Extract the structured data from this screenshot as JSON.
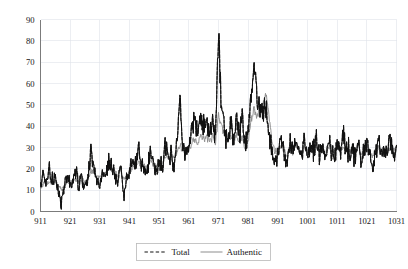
{
  "chart_data": {
    "type": "line",
    "title": "",
    "subtitle": "",
    "xlabel": "",
    "ylabel": "",
    "xlim": [
      911,
      1031
    ],
    "ylim": [
      0,
      90
    ],
    "grid": true,
    "legend_position": "bottom-center",
    "y_ticks": [
      0,
      10,
      20,
      30,
      40,
      50,
      60,
      70,
      80,
      90
    ],
    "y_tick_labels": [
      "0",
      "10",
      "20",
      "30",
      "40",
      "50",
      "60",
      "70",
      "80",
      "90"
    ],
    "x_ticks": [
      911,
      921,
      931,
      941,
      951,
      961,
      971,
      981,
      991,
      1001,
      1011,
      1021,
      1031
    ],
    "x_tick_labels": [
      "911",
      "921",
      "931",
      "941",
      "951",
      "961",
      "971",
      "981",
      "991",
      "1001",
      "1011",
      "1021",
      "1031"
    ],
    "series": [
      {
        "name": "Total",
        "style": "dashed",
        "color": "#111111",
        "x_start": 911,
        "x_step": 1,
        "values": [
          11,
          19,
          14,
          20,
          13,
          16,
          10,
          4,
          12,
          17,
          13,
          14,
          19,
          12,
          16,
          11,
          17,
          28,
          21,
          14,
          12,
          19,
          15,
          23,
          21,
          18,
          12,
          22,
          9,
          15,
          19,
          26,
          21,
          32,
          19,
          23,
          17,
          31,
          22,
          18,
          24,
          20,
          31,
          25,
          27,
          23,
          34,
          52,
          30,
          26,
          29,
          38,
          41,
          35,
          45,
          38,
          42,
          36,
          41,
          34,
          82,
          49,
          38,
          34,
          41,
          33,
          46,
          36,
          44,
          30,
          38,
          55,
          69,
          53,
          49,
          48,
          50,
          37,
          28,
          24,
          29,
          34,
          27,
          22,
          32,
          27,
          36,
          30,
          26,
          33,
          25,
          31,
          28,
          35,
          26,
          30,
          24,
          34,
          29,
          25,
          32,
          28,
          36,
          29,
          24,
          30,
          26,
          31,
          24,
          29,
          33,
          27,
          22,
          28,
          32,
          25,
          30,
          27,
          33,
          26,
          31
        ]
      },
      {
        "name": "Authentic",
        "style": "solid",
        "color": "#8d8d8d",
        "x_start": 911,
        "x_step": 1,
        "values": [
          11,
          13,
          13,
          14,
          13,
          14,
          12,
          10,
          12,
          14,
          14,
          14,
          15,
          14,
          15,
          14,
          16,
          19,
          19,
          17,
          16,
          18,
          18,
          20,
          20,
          19,
          17,
          20,
          15,
          16,
          18,
          21,
          21,
          23,
          21,
          22,
          20,
          24,
          22,
          21,
          23,
          22,
          26,
          25,
          26,
          25,
          28,
          31,
          29,
          28,
          29,
          32,
          34,
          32,
          36,
          34,
          35,
          33,
          35,
          32,
          45,
          40,
          36,
          33,
          35,
          32,
          36,
          33,
          35,
          30,
          33,
          43,
          48,
          45,
          49,
          50,
          56,
          46,
          33,
          28,
          29,
          31,
          29,
          26,
          30,
          28,
          31,
          29,
          27,
          30,
          28,
          30,
          29,
          31,
          28,
          29,
          27,
          31,
          29,
          28,
          30,
          29,
          31,
          29,
          27,
          29,
          28,
          30,
          27,
          29,
          30,
          28,
          26,
          29,
          30,
          27,
          29,
          28,
          30,
          28,
          30
        ]
      }
    ],
    "legend": [
      {
        "label": "Total",
        "style": "dashed",
        "color": "#111111"
      },
      {
        "label": "Authentic",
        "style": "solid",
        "color": "#8d8d8d"
      }
    ],
    "annotations": {
      "max_peak_value": 82,
      "max_peak_x": 971,
      "second_peak_value": 69,
      "second_peak_x": 983
    }
  },
  "colors": {
    "background": "#ffffff",
    "grid": "#dfe3ea",
    "axis": "#7b7b7b",
    "total": "#111111",
    "authentic": "#8d8d8d",
    "text": "#151515"
  }
}
